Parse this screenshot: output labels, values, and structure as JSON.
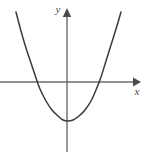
{
  "figure": {
    "background_color": "#ffffff",
    "width": 150,
    "height": 158
  },
  "axes": {
    "x_axis": {
      "label": "x",
      "label_x": 137,
      "label_y": 95,
      "color": "#6b6b6b",
      "stroke_width": 1.4,
      "y_pixel": 82,
      "x_start": 0,
      "x_end": 141,
      "arrow": "right-arrowhead"
    },
    "y_axis": {
      "label": "y",
      "label_x": 58,
      "label_y": 13,
      "color": "#6b6b6b",
      "stroke_width": 1.4,
      "x_pixel": 67,
      "y_start": 10,
      "y_end": 152,
      "arrow": "up-arrowhead"
    }
  },
  "chart_data": {
    "type": "line",
    "title": "",
    "xlabel": "x",
    "ylabel": "y",
    "grid": false,
    "legend": null,
    "curve": {
      "name": "parabola",
      "shape": "upward-opening-parabola",
      "color": "#3a3a3a",
      "stroke_width": 1.5,
      "vertex_pixel": [
        68,
        121
      ],
      "x_intercepts_pixel": [
        35,
        101
      ],
      "y_intercept_pixel": [
        67,
        121
      ],
      "endpoints_pixel": [
        [
          16,
          12
        ],
        [
          121,
          12
        ]
      ],
      "points_pixel": [
        [
          16,
          12
        ],
        [
          21,
          31
        ],
        [
          26,
          48
        ],
        [
          31,
          63
        ],
        [
          35,
          75
        ],
        [
          40,
          89
        ],
        [
          46,
          101
        ],
        [
          52,
          110
        ],
        [
          58,
          116
        ],
        [
          63,
          120
        ],
        [
          68,
          121
        ],
        [
          73,
          120
        ],
        [
          79,
          116
        ],
        [
          85,
          110
        ],
        [
          91,
          101
        ],
        [
          96,
          90
        ],
        [
          101,
          77
        ],
        [
          106,
          61
        ],
        [
          111,
          45
        ],
        [
          116,
          29
        ],
        [
          121,
          12
        ]
      ]
    }
  }
}
